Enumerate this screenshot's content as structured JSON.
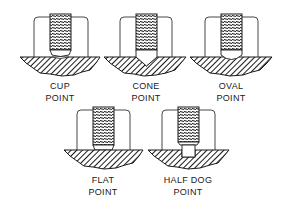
{
  "diagram": {
    "colors": {
      "line": "#1a1a1a",
      "background": "#ffffff",
      "hatch": "#1a1a1a"
    },
    "screws": [
      {
        "id": "cup",
        "line1": "CUP",
        "line2": "POINT"
      },
      {
        "id": "cone",
        "line1": "CONE",
        "line2": "POINT"
      },
      {
        "id": "oval",
        "line1": "OVAL",
        "line2": "POINT"
      },
      {
        "id": "flat",
        "line1": "FLAT",
        "line2": "POINT"
      },
      {
        "id": "half-dog",
        "line1": "HALF DOG",
        "line2": "POINT"
      }
    ]
  }
}
